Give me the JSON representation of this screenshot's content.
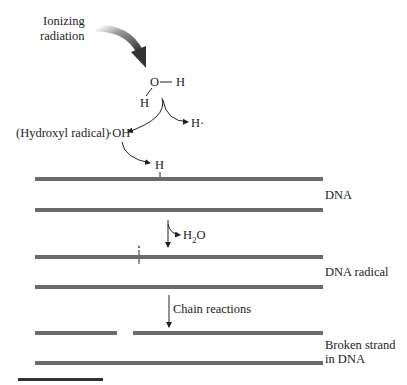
{
  "labels": {
    "ionizing_line1": "Ionizing",
    "ionizing_line2": "radiation",
    "water_O": "O",
    "water_H_right": "H",
    "water_H_bottom": "H",
    "h_radical": "H·",
    "hydroxyl_label": "(Hydroxyl radical)",
    "hydroxyl_formula": "·OH",
    "dna_H": "H",
    "dna": "DNA",
    "h2o_H": "H",
    "h2o_sub": "2",
    "h2o_O": "O",
    "dna_radical": "DNA radical",
    "chain_reactions": "Chain reactions",
    "broken_line1": "Broken strand",
    "broken_line2": "in DNA"
  },
  "colors": {
    "strand": "#6b6b6b",
    "text": "#222222",
    "arrow_dark": "#3a3a3a"
  }
}
